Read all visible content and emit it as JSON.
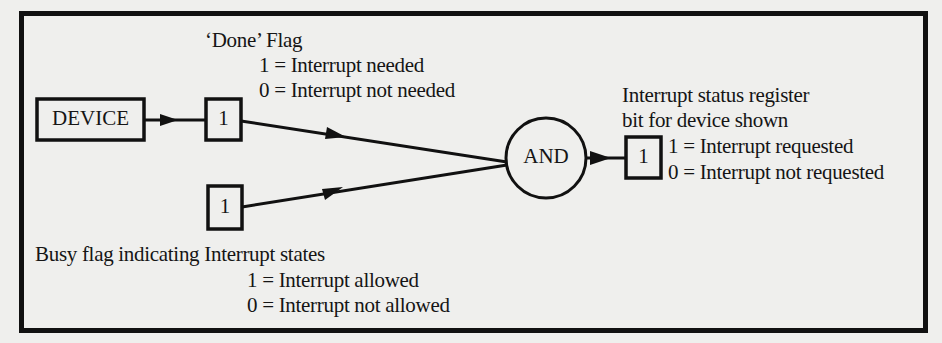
{
  "diagram": {
    "device_box": {
      "label": "DEVICE"
    },
    "done_flag": {
      "title": "‘Done’ Flag",
      "value": "1",
      "line1": "1 = Interrupt needed",
      "line2": "0 = Interrupt not needed"
    },
    "busy_flag": {
      "title": "Busy flag indicating Interrupt states",
      "value": "1",
      "line1": "1 = Interrupt allowed",
      "line2": "0 = Interrupt not allowed"
    },
    "and_gate": {
      "label": "AND"
    },
    "status_register": {
      "title_line1": "Interrupt status register",
      "title_line2": "bit for device shown",
      "value": "1",
      "line1": "1 = Interrupt requested",
      "line2": "0 = Interrupt not requested"
    },
    "colors": {
      "ink": "#111111",
      "paper": "#efefed"
    }
  }
}
